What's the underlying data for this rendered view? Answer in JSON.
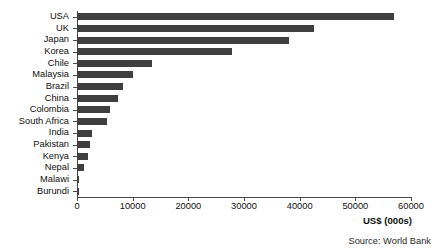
{
  "chart_data": {
    "type": "bar",
    "orientation": "horizontal",
    "title": "",
    "subtitle": "",
    "xlabel": "US$ (000s)",
    "ylabel": "",
    "xlim": [
      0,
      60000
    ],
    "xticks": [
      0,
      10000,
      20000,
      30000,
      40000,
      50000,
      60000
    ],
    "xtick_labels": [
      "0",
      "10000",
      "20000",
      "30000",
      "40000",
      "50000",
      "60000"
    ],
    "grid": false,
    "legend": null,
    "bar_color": "#3f3f3f",
    "axis_color": "#4a4a4a",
    "categories": [
      "USA",
      "UK",
      "Japan",
      "Korea",
      "Chile",
      "Malaysia",
      "Brazil",
      "China",
      "Colombia",
      "South Africa",
      "India",
      "Pakistan",
      "Kenya",
      "Nepal",
      "Malawi",
      "Burundi"
    ],
    "values": [
      57000,
      42500,
      38000,
      27800,
      13500,
      10000,
      8300,
      7400,
      6000,
      5400,
      2700,
      2400,
      2000,
      1200,
      400,
      300
    ],
    "annotations": [
      "Source: World Bank"
    ]
  },
  "notes": {
    "source": "Source: World Bank"
  }
}
